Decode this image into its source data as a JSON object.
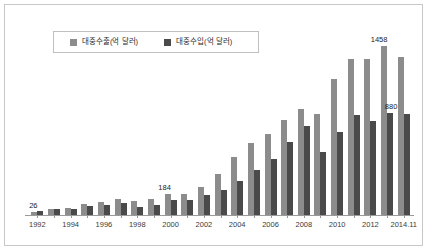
{
  "chart_data": {
    "type": "bar",
    "title": "",
    "xlabel": "",
    "ylabel": "",
    "grid": false,
    "legend_position": "top-left",
    "ylim": [
      0,
      1600
    ],
    "categories": [
      "1992",
      "1993",
      "1994",
      "1995",
      "1996",
      "1997",
      "1998",
      "1999",
      "2000",
      "2001",
      "2002",
      "2003",
      "2004",
      "2005",
      "2006",
      "2007",
      "2008",
      "2009",
      "2010",
      "2011",
      "2012",
      "2013",
      "2014.11"
    ],
    "tick_labels": [
      "1992",
      "",
      "1994",
      "",
      "1996",
      "",
      "1998",
      "",
      "2000",
      "",
      "2002",
      "",
      "2004",
      "",
      "2006",
      "",
      "2008",
      "",
      "2010",
      "",
      "2012",
      "",
      "2014.11"
    ],
    "series": [
      {
        "name": "대중수출(억 달러)",
        "color": "#8c8c8c",
        "values": [
          26,
          52,
          62,
          92,
          114,
          136,
          120,
          137,
          184,
          182,
          238,
          351,
          498,
          619,
          695,
          820,
          914,
          867,
          1168,
          1342,
          1343,
          1458,
          1361
        ]
      },
      {
        "name": "대중수입(억 달러)",
        "color": "#4a4a4a",
        "values": [
          37,
          51,
          55,
          74,
          85,
          101,
          65,
          89,
          128,
          133,
          174,
          219,
          296,
          386,
          486,
          630,
          769,
          542,
          716,
          864,
          807,
          880,
          870
        ]
      }
    ],
    "annotations": [
      {
        "label": "26",
        "category": "1992",
        "series": "대중수출(억 달러)"
      },
      {
        "label": "184",
        "category": "2000",
        "series": "대중수출(억 달러)"
      },
      {
        "label": "1458",
        "category": "2013",
        "series": "대중수출(억 달러)"
      },
      {
        "label": "880",
        "category": "2013",
        "series": "대중수입(억 달러)"
      }
    ]
  },
  "legend": {
    "entries": [
      {
        "label": "대중수출(억 달러)",
        "color": "#8c8c8c"
      },
      {
        "label": "대중수입(억 달러)",
        "color": "#4a4a4a"
      }
    ]
  },
  "colors": {
    "export": "#8c8c8c",
    "import": "#4a4a4a",
    "frame": "#c8c8c8",
    "axis": "#9a9a9a",
    "background": "#ffffff",
    "text": "#2b2b2b"
  }
}
